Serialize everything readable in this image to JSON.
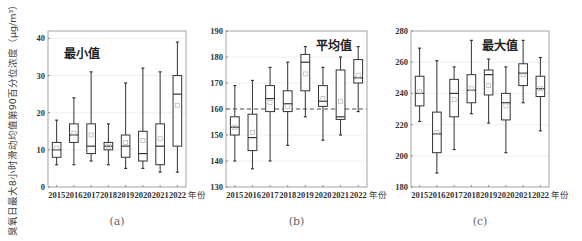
{
  "figure": {
    "y_axis_label": "臭氧日最大8小时滑动均值第90百分位浓度（μg/m³）",
    "x_unit_label": "年份"
  },
  "chart_data": [
    {
      "type": "box",
      "panel_label": "(a)",
      "title": "最小值",
      "xlabel": "年份",
      "ylabel": "臭氧日最大8小时滑动均值第90百分位浓度（μg/m³）",
      "categories": [
        "2015",
        "2016",
        "2017",
        "2018",
        "2019",
        "2020",
        "2021",
        "2022"
      ],
      "ylim": [
        0,
        42
      ],
      "yticks": [
        0,
        10,
        20,
        30,
        40
      ],
      "grid": true,
      "reference_line": null,
      "boxes": [
        {
          "min": 6,
          "q1": 8,
          "median": 10,
          "q3": 12,
          "max": 18,
          "mean": 10.5
        },
        {
          "min": 6,
          "q1": 12,
          "median": 14,
          "q3": 17,
          "max": 24,
          "mean": 14.5
        },
        {
          "min": 7,
          "q1": 9,
          "median": 11,
          "q3": 17,
          "max": 31,
          "mean": 14
        },
        {
          "min": 6,
          "q1": 10,
          "median": 11,
          "q3": 12,
          "max": 17,
          "mean": 11
        },
        {
          "min": 5,
          "q1": 8,
          "median": 11,
          "q3": 14,
          "max": 28,
          "mean": 12
        },
        {
          "min": 5,
          "q1": 7,
          "median": 9,
          "q3": 15,
          "max": 32,
          "mean": 12.5
        },
        {
          "min": 4,
          "q1": 6,
          "median": 11,
          "q3": 17,
          "max": 31,
          "mean": 13
        },
        {
          "min": 4,
          "q1": 11,
          "median": 25,
          "q3": 30,
          "max": 39,
          "mean": 22
        }
      ]
    },
    {
      "type": "box",
      "panel_label": "(b)",
      "title": "平均值",
      "xlabel": "年份",
      "categories": [
        "2015",
        "2016",
        "2017",
        "2018",
        "2019",
        "2020",
        "2021",
        "2022"
      ],
      "ylim": [
        130,
        190
      ],
      "yticks": [
        130,
        140,
        150,
        160,
        170,
        180,
        190
      ],
      "grid": true,
      "reference_line": 160,
      "boxes": [
        {
          "min": 140,
          "q1": 150,
          "median": 153,
          "q3": 157,
          "max": 169,
          "mean": 153
        },
        {
          "min": 137,
          "q1": 144,
          "median": 149,
          "q3": 158,
          "max": 171,
          "mean": 151
        },
        {
          "min": 140,
          "q1": 159,
          "median": 164,
          "q3": 169,
          "max": 176,
          "mean": 162.5
        },
        {
          "min": 146,
          "q1": 159,
          "median": 162,
          "q3": 167,
          "max": 178,
          "mean": 161
        },
        {
          "min": 157,
          "q1": 167,
          "median": 178,
          "q3": 181,
          "max": 184,
          "mean": 173.5
        },
        {
          "min": 148,
          "q1": 161,
          "median": 163,
          "q3": 169,
          "max": 176,
          "mean": 164
        },
        {
          "min": 150,
          "q1": 156,
          "median": 157,
          "q3": 175,
          "max": 180,
          "mean": 163
        },
        {
          "min": 159,
          "q1": 170,
          "median": 172,
          "q3": 179,
          "max": 184,
          "mean": 173
        }
      ]
    },
    {
      "type": "box",
      "panel_label": "(c)",
      "title": "最大值",
      "xlabel": "年份",
      "categories": [
        "2015",
        "2016",
        "2017",
        "2018",
        "2019",
        "2020",
        "2021",
        "2022"
      ],
      "ylim": [
        180,
        280
      ],
      "yticks": [
        180,
        200,
        220,
        240,
        260,
        280
      ],
      "grid": true,
      "reference_line": null,
      "boxes": [
        {
          "min": 222,
          "q1": 232,
          "median": 240,
          "q3": 251,
          "max": 269,
          "mean": 241
        },
        {
          "min": 189,
          "q1": 202,
          "median": 214,
          "q3": 228,
          "max": 261,
          "mean": 215
        },
        {
          "min": 204,
          "q1": 225,
          "median": 240,
          "q3": 249,
          "max": 257,
          "mean": 236
        },
        {
          "min": 227,
          "q1": 234,
          "median": 242,
          "q3": 252,
          "max": 274,
          "mean": 243
        },
        {
          "min": 221,
          "q1": 239,
          "median": 252,
          "q3": 255,
          "max": 262,
          "mean": 245
        },
        {
          "min": 202,
          "q1": 223,
          "median": 234,
          "q3": 240,
          "max": 257,
          "mean": 232
        },
        {
          "min": 234,
          "q1": 245,
          "median": 253,
          "q3": 259,
          "max": 274,
          "mean": 252
        },
        {
          "min": 216,
          "q1": 238,
          "median": 243,
          "q3": 251,
          "max": 263,
          "mean": 243
        }
      ]
    }
  ]
}
